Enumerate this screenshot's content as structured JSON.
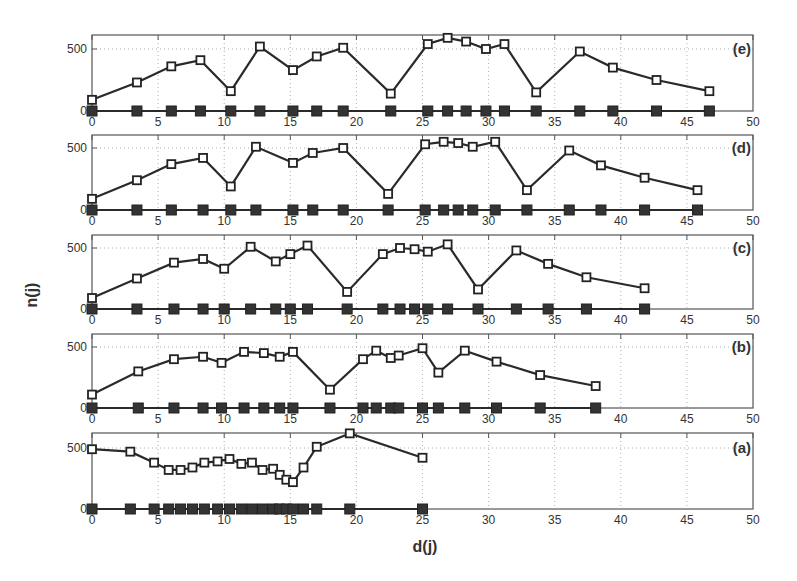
{
  "chart_data": {
    "type": "line",
    "title": "",
    "xlabel": "d(j)",
    "ylabel": "n(j)",
    "xlim": [
      0,
      50
    ],
    "xticks": [
      0,
      5,
      10,
      15,
      20,
      25,
      30,
      35,
      40,
      45,
      50
    ],
    "yticks": [
      0,
      500
    ],
    "grid": true,
    "panels": [
      {
        "label": "(e)",
        "ylim": [
          0,
          610
        ],
        "series": [
          {
            "name": "n(j)",
            "marker": "open-square",
            "x": [
              0,
              3.4,
              6.0,
              8.2,
              10.5,
              12.7,
              15.2,
              17.0,
              19.0,
              22.6,
              25.4,
              26.9,
              28.3,
              29.8,
              31.2,
              33.6,
              36.9,
              39.4,
              42.7,
              46.7
            ],
            "y": [
              90,
              230,
              360,
              410,
              160,
              520,
              330,
              440,
              510,
              140,
              540,
              590,
              560,
              500,
              540,
              150,
              480,
              350,
              250,
              160
            ]
          },
          {
            "name": "baseline",
            "marker": "filled-square",
            "x": [
              0,
              3.4,
              6.0,
              8.2,
              10.5,
              12.7,
              15.2,
              17.0,
              19.0,
              22.6,
              25.4,
              26.9,
              28.3,
              29.8,
              31.2,
              33.6,
              36.9,
              39.4,
              42.7,
              46.7
            ],
            "y": [
              0,
              0,
              0,
              0,
              0,
              0,
              0,
              0,
              0,
              0,
              0,
              0,
              0,
              0,
              0,
              0,
              0,
              0,
              0,
              0
            ]
          }
        ]
      },
      {
        "label": "(d)",
        "ylim": [
          0,
          610
        ],
        "series": [
          {
            "name": "n(j)",
            "marker": "open-square",
            "x": [
              0,
              3.4,
              6.0,
              8.4,
              10.5,
              12.4,
              15.2,
              16.7,
              19.0,
              22.4,
              25.2,
              26.6,
              27.7,
              28.8,
              30.5,
              32.9,
              36.1,
              38.5,
              41.8,
              45.8
            ],
            "y": [
              90,
              240,
              370,
              420,
              190,
              510,
              380,
              460,
              500,
              130,
              530,
              550,
              540,
              510,
              550,
              160,
              480,
              360,
              260,
              160
            ]
          },
          {
            "name": "baseline",
            "marker": "filled-square",
            "x": [
              0,
              3.4,
              6.0,
              8.4,
              10.5,
              12.4,
              15.2,
              16.7,
              19.0,
              22.4,
              25.2,
              26.6,
              27.7,
              28.8,
              30.5,
              32.9,
              36.1,
              38.5,
              41.8,
              45.8
            ],
            "y": [
              0,
              0,
              0,
              0,
              0,
              0,
              0,
              0,
              0,
              0,
              0,
              0,
              0,
              0,
              0,
              0,
              0,
              0,
              0,
              0
            ]
          }
        ]
      },
      {
        "label": "(c)",
        "ylim": [
          0,
          610
        ],
        "series": [
          {
            "name": "n(j)",
            "marker": "open-square",
            "x": [
              0,
              3.4,
              6.2,
              8.4,
              10.0,
              12.0,
              13.9,
              15.0,
              16.3,
              19.3,
              22.0,
              23.3,
              24.4,
              25.4,
              26.9,
              29.2,
              32.1,
              34.5,
              37.4,
              41.8
            ],
            "y": [
              90,
              250,
              380,
              410,
              330,
              510,
              390,
              450,
              520,
              140,
              450,
              500,
              490,
              470,
              530,
              160,
              480,
              370,
              260,
              170
            ]
          },
          {
            "name": "baseline",
            "marker": "filled-square",
            "x": [
              0,
              3.4,
              6.2,
              8.4,
              10.0,
              12.0,
              13.9,
              15.0,
              16.3,
              19.3,
              22.0,
              23.3,
              24.4,
              25.4,
              26.9,
              29.2,
              32.1,
              34.5,
              37.4,
              41.8
            ],
            "y": [
              0,
              0,
              0,
              0,
              0,
              0,
              0,
              0,
              0,
              0,
              0,
              0,
              0,
              0,
              0,
              0,
              0,
              0,
              0,
              0
            ]
          }
        ]
      },
      {
        "label": "(b)",
        "ylim": [
          0,
          610
        ],
        "series": [
          {
            "name": "n(j)",
            "marker": "open-square",
            "x": [
              0,
              3.5,
              6.2,
              8.4,
              9.8,
              11.5,
              13.0,
              14.2,
              15.2,
              18.0,
              20.5,
              21.5,
              22.6,
              23.2,
              25.0,
              26.2,
              28.2,
              30.6,
              33.9,
              38.1
            ],
            "y": [
              110,
              300,
              400,
              420,
              370,
              460,
              450,
              420,
              460,
              150,
              400,
              470,
              410,
              430,
              490,
              290,
              470,
              380,
              270,
              180
            ]
          },
          {
            "name": "baseline",
            "marker": "filled-square",
            "x": [
              0,
              3.5,
              6.2,
              8.4,
              9.8,
              11.5,
              13.0,
              14.2,
              15.2,
              18.0,
              20.5,
              21.5,
              22.6,
              23.2,
              25.0,
              26.2,
              28.2,
              30.6,
              33.9,
              38.1
            ],
            "y": [
              0,
              0,
              0,
              0,
              0,
              0,
              0,
              0,
              0,
              0,
              0,
              0,
              0,
              0,
              0,
              0,
              0,
              0,
              0,
              0
            ]
          }
        ]
      },
      {
        "label": "(a)",
        "ylim": [
          0,
          610
        ],
        "series": [
          {
            "name": "n(j)",
            "marker": "open-square",
            "x": [
              0,
              2.9,
              4.7,
              5.8,
              6.7,
              7.6,
              8.5,
              9.5,
              10.4,
              11.3,
              12.1,
              12.9,
              13.7,
              14.2,
              14.7,
              15.2,
              16.0,
              17.0,
              19.5,
              25.0
            ],
            "y": [
              490,
              470,
              380,
              320,
              320,
              340,
              380,
              390,
              410,
              370,
              380,
              320,
              330,
              280,
              240,
              220,
              340,
              510,
              620,
              420
            ]
          },
          {
            "name": "baseline",
            "marker": "filled-square",
            "x": [
              0,
              2.9,
              4.7,
              5.8,
              6.7,
              7.6,
              8.5,
              9.5,
              10.4,
              11.3,
              12.1,
              12.9,
              13.7,
              14.2,
              14.7,
              15.2,
              16.0,
              17.0,
              19.5,
              25.0
            ],
            "y": [
              0,
              0,
              0,
              0,
              0,
              0,
              0,
              0,
              0,
              0,
              0,
              0,
              0,
              0,
              0,
              0,
              0,
              0,
              0,
              0
            ]
          }
        ]
      }
    ]
  },
  "layout": {
    "x0_px": 92,
    "x1_px": 753,
    "panels_px": [
      {
        "top": 35,
        "zero": 111,
        "y500": 49
      },
      {
        "top": 135,
        "zero": 210,
        "y500": 148
      },
      {
        "top": 235,
        "zero": 309,
        "y500": 248
      },
      {
        "top": 334,
        "zero": 408,
        "y500": 347
      },
      {
        "top": 433,
        "zero": 509,
        "y500": 448
      }
    ],
    "colors": {
      "line": "#2a2a2a",
      "frame": "#555555",
      "grid": "#999999",
      "text": "#333333"
    }
  }
}
